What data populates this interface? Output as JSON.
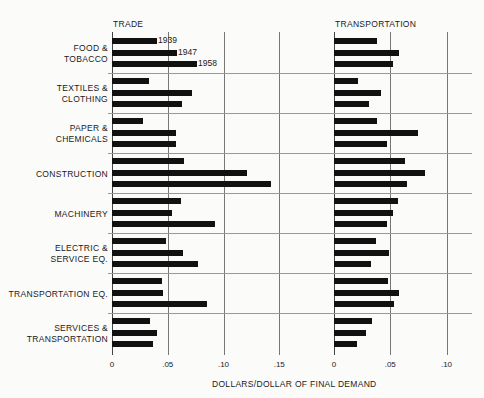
{
  "chart_data": {
    "type": "bar",
    "orientation": "horizontal",
    "xlabel": "DOLLARS/DOLLAR OF FINAL DEMAND",
    "legend": [
      "1939",
      "1947",
      "1958"
    ],
    "categories": [
      "FOOD & TOBACCO",
      "TEXTILES & CLOTHING",
      "PAPER & CHEMICALS",
      "CONSTRUCTION",
      "MACHINERY",
      "ELECTRIC & SERVICE EQ.",
      "TRANSPORTATION EQ.",
      "SERVICES & TRANSPORTATION"
    ],
    "panels": [
      {
        "title": "TRADE",
        "xlim": [
          0,
          0.17
        ],
        "ticks": [
          "0",
          ".05",
          ".10",
          ".15"
        ],
        "series": [
          {
            "name": "1939",
            "values": [
              0.04,
              0.033,
              0.028,
              0.065,
              0.062,
              0.048,
              0.045,
              0.034
            ]
          },
          {
            "name": "1947",
            "values": [
              0.058,
              0.072,
              0.057,
              0.121,
              0.054,
              0.064,
              0.046,
              0.04
            ]
          },
          {
            "name": "1958",
            "values": [
              0.076,
              0.063,
              0.057,
              0.143,
              0.092,
              0.077,
              0.085,
              0.037
            ]
          }
        ]
      },
      {
        "title": "TRANSPORTATION",
        "xlim": [
          0,
          0.11
        ],
        "ticks": [
          "0",
          ".05",
          ".10"
        ],
        "series": [
          {
            "name": "1939",
            "values": [
              0.038,
              0.021,
              0.038,
              0.063,
              0.057,
              0.037,
              0.048,
              0.034
            ]
          },
          {
            "name": "1947",
            "values": [
              0.058,
              0.042,
              0.075,
              0.081,
              0.052,
              0.049,
              0.058,
              0.028
            ]
          },
          {
            "name": "1958",
            "values": [
              0.052,
              0.031,
              0.047,
              0.065,
              0.047,
              0.033,
              0.053,
              0.02
            ]
          }
        ]
      }
    ]
  },
  "labels": {
    "trade_title": "TRADE",
    "transport_title": "TRANSPORTATION",
    "xlabel": "DOLLARS/DOLLAR OF FINAL DEMAND",
    "categories": [
      [
        "FOOD &",
        "TOBACCO"
      ],
      [
        "TEXTILES &",
        "CLOTHING"
      ],
      [
        "PAPER &",
        "CHEMICALS"
      ],
      [
        "CONSTRUCTION"
      ],
      [
        "MACHINERY"
      ],
      [
        "ELECTRIC &",
        "SERVICE EQ."
      ],
      [
        "TRANSPORTATION EQ."
      ],
      [
        "SERVICES &",
        "TRANSPORTATION"
      ]
    ],
    "years": [
      "1939",
      "1947",
      "1958"
    ]
  }
}
